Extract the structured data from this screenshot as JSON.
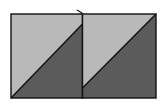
{
  "diagram": {
    "colors": {
      "background": "#ffffff",
      "light_fill": "#b9b9b9",
      "dark_fill": "#5b5b5b",
      "stroke": "#111111"
    },
    "panels": [
      {
        "id": "left-square",
        "x": 11,
        "y": 14,
        "w": 71.5,
        "h": 84,
        "diagonal": {
          "x1": 11,
          "y1": 98,
          "x2": 82.5,
          "y2": 24
        }
      },
      {
        "id": "right-square",
        "x": 82.5,
        "y": 14,
        "w": 73.5,
        "h": 84,
        "diagonal": {
          "x1": 82.5,
          "y1": 88,
          "x2": 156,
          "y2": 14
        }
      }
    ],
    "divider_tick": {
      "x": 77,
      "y": 10
    }
  }
}
